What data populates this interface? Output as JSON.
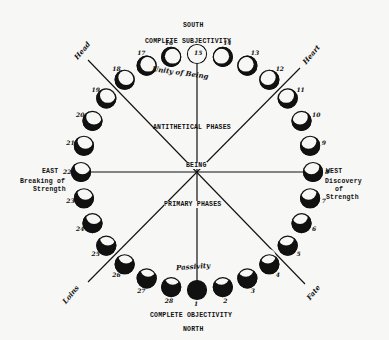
{
  "diagram": {
    "title_top": "SOUTH",
    "title_bottom": "NORTH",
    "top_label": "COMPLETE SUBJECTIVITY",
    "bottom_label": "COMPLETE OBJECTIVITY",
    "upper_region_label": "ANTITHETICAL PHASES",
    "lower_region_label": "PRIMARY PHASES",
    "center_label": "BEING",
    "east": {
      "title": "EAST",
      "line1": "Breaking of",
      "line2": "Strength"
    },
    "west": {
      "title": "WEST",
      "line1": "Discovery",
      "line2": "of",
      "line3": "Strength"
    },
    "top_arc_label": "Unity of Being",
    "bottom_arc_label": "Passivity",
    "quadrant_labels": {
      "upper_left": "Head",
      "upper_right": "Heart",
      "lower_left": "Loins",
      "lower_right": "Fate"
    },
    "phase_numbers": [
      "1",
      "2",
      "3",
      "4",
      "5",
      "6",
      "7",
      "8",
      "9",
      "10",
      "11",
      "12",
      "13",
      "14",
      "15",
      "16",
      "17",
      "18",
      "19",
      "20",
      "21",
      "22",
      "23",
      "24",
      "25",
      "26",
      "27",
      "28"
    ]
  }
}
